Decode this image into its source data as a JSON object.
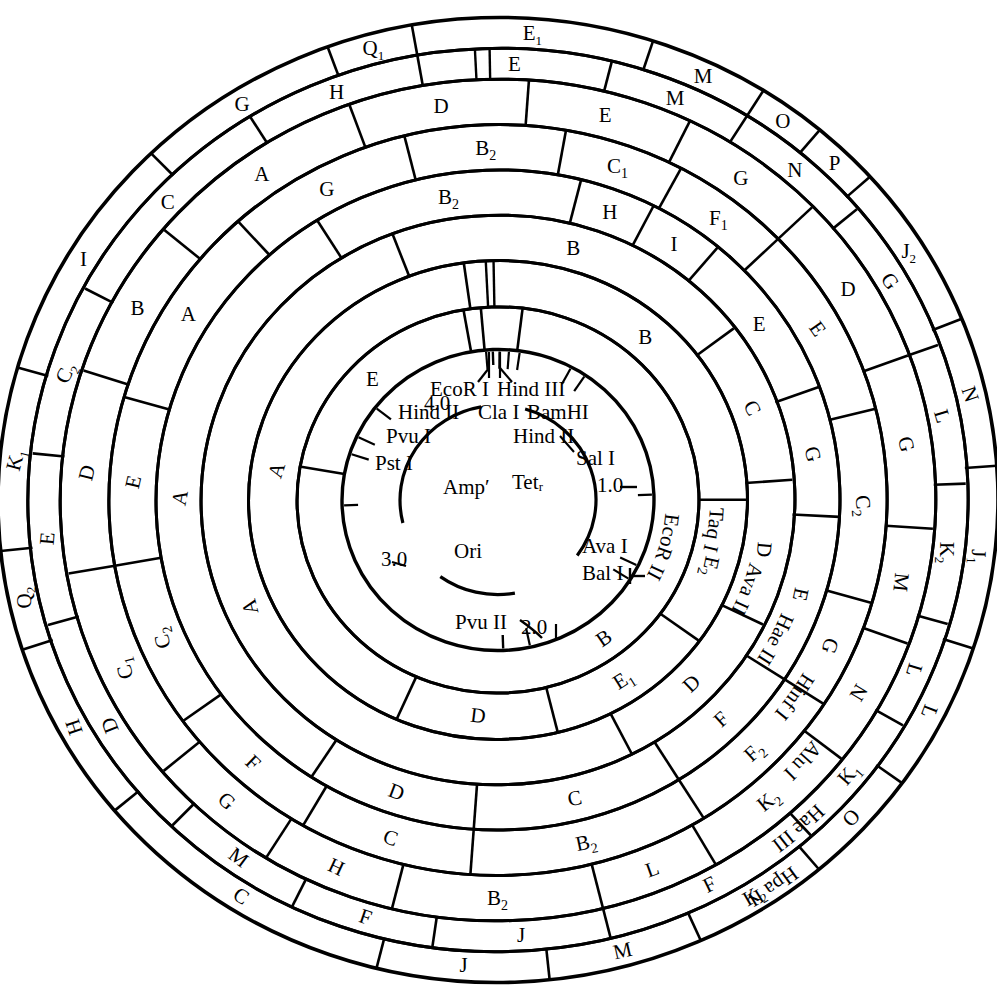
{
  "figure": {
    "type": "circular-restriction-map",
    "plasmid": "pBR322",
    "center": {
      "cx": 498,
      "cy": 500
    },
    "coordinates": [
      "1.0",
      "2.0",
      "3.0",
      "4.0"
    ],
    "genes": [
      "Amp′",
      "Tetᵣ",
      "Ori"
    ],
    "inner_sites": [
      "EcoR I",
      "Hind III",
      "Cla I",
      "BamHI",
      "Hind II",
      "Sal I",
      "Hind II",
      "Pvu I",
      "Pst I",
      "Ava I",
      "Bal I",
      "Pvu II"
    ]
  },
  "rings": [
    {
      "index": 0,
      "enzyme": "EcoR II",
      "enzyme_label_angle": 108,
      "r_inner": 156,
      "r_outer": 200,
      "segments": [
        {
          "label": "B",
          "start": 9,
          "end": 282
        },
        {
          "label": "E",
          "start": 282,
          "end": 352
        },
        {
          "label": "",
          "start": 352,
          "end": 357
        },
        {
          "label": "",
          "start": 357,
          "end": 369
        }
      ]
    },
    {
      "index": 1,
      "enzyme": "Taq I",
      "enzyme_label_angle": 100,
      "r_inner": 200,
      "r_outer": 248,
      "segments": [
        {
          "label": "B",
          "start": 354,
          "end": 92
        },
        {
          "label": "E₂",
          "start": 92,
          "end": 128
        },
        {
          "label": "E₁",
          "start": 128,
          "end": 168
        },
        {
          "label": "D",
          "start": 168,
          "end": 206
        },
        {
          "label": "A",
          "start": 206,
          "end": 354
        }
      ]
    },
    {
      "index": 2,
      "enzyme": "Ava II",
      "enzyme_label_angle": 112,
      "r_inner": 248,
      "r_outer": 295,
      "segments": [
        {
          "label": "B",
          "start": 341,
          "end": 55
        },
        {
          "label": "C",
          "start": 55,
          "end": 88
        },
        {
          "label": "D",
          "start": 88,
          "end": 118
        },
        {
          "label": "D",
          "start": 118,
          "end": 155
        },
        {
          "label": "A",
          "start": 155,
          "end": 341
        }
      ]
    },
    {
      "index": 3,
      "enzyme": "Hae II",
      "enzyme_label_angle": 119,
      "r_inner": 295,
      "r_outer": 342,
      "segments": [
        {
          "label": "B₂",
          "start": 330,
          "end": 16
        },
        {
          "label": "H",
          "start": 16,
          "end": 29
        },
        {
          "label": "I",
          "start": 29,
          "end": 42
        },
        {
          "label": "E",
          "start": 42,
          "end": 72
        },
        {
          "label": "G",
          "start": 72,
          "end": 95
        },
        {
          "label": "E",
          "start": 95,
          "end": 125
        },
        {
          "label": "F",
          "start": 125,
          "end": 150
        },
        {
          "label": "C",
          "start": 150,
          "end": 186
        },
        {
          "label": "D",
          "start": 186,
          "end": 215
        },
        {
          "label": "A",
          "start": 215,
          "end": 330
        }
      ]
    },
    {
      "index": 4,
      "enzyme": "Hinf I",
      "enzyme_label_angle": 126,
      "r_inner": 342,
      "r_outer": 389,
      "segments": [
        {
          "label": "G",
          "start": 320,
          "end": 348
        },
        {
          "label": "B₂",
          "start": 348,
          "end": 12
        },
        {
          "label": "C₁",
          "start": 12,
          "end": 30
        },
        {
          "label": "F₁",
          "start": 30,
          "end": 48
        },
        {
          "label": "E",
          "start": 48,
          "end": 78
        },
        {
          "label": "C₂",
          "start": 78,
          "end": 108
        },
        {
          "label": "G",
          "start": 108,
          "end": 125
        },
        {
          "label": "F₂",
          "start": 125,
          "end": 150
        },
        {
          "label": "B₂",
          "start": 150,
          "end": 186
        },
        {
          "label": "C",
          "start": 186,
          "end": 212
        },
        {
          "label": "F",
          "start": 212,
          "end": 236
        },
        {
          "label": "C₂",
          "start": 236,
          "end": 262
        },
        {
          "label": "E",
          "start": 262,
          "end": 288
        },
        {
          "label": "A",
          "start": 288,
          "end": 320
        }
      ]
    },
    {
      "index": 5,
      "enzyme": "Alu I",
      "enzyme_label_angle": 133,
      "r_inner": 389,
      "r_outer": 436,
      "segments": [
        {
          "label": "A",
          "start": 312,
          "end": 342
        },
        {
          "label": "D",
          "start": 342,
          "end": 6
        },
        {
          "label": "E",
          "start": 6,
          "end": 28
        },
        {
          "label": "G",
          "start": 28,
          "end": 48
        },
        {
          "label": "D",
          "start": 48,
          "end": 72
        },
        {
          "label": "G",
          "start": 72,
          "end": 96
        },
        {
          "label": "M",
          "start": 96,
          "end": 112
        },
        {
          "label": "N",
          "start": 112,
          "end": 130
        },
        {
          "label": "K₂",
          "start": 130,
          "end": 152
        },
        {
          "label": "L",
          "start": 152,
          "end": 168
        },
        {
          "label": "B₂",
          "start": 168,
          "end": 196
        },
        {
          "label": "H",
          "start": 196,
          "end": 214
        },
        {
          "label": "G",
          "start": 214,
          "end": 232
        },
        {
          "label": "C₁",
          "start": 232,
          "end": 262
        },
        {
          "label": "D",
          "start": 262,
          "end": 290
        },
        {
          "label": "B",
          "start": 290,
          "end": 312
        }
      ]
    },
    {
      "index": 6,
      "enzyme": "Hae III",
      "enzyme_label_angle": 140,
      "r_inner": 436,
      "r_outer": 468,
      "segments": [
        {
          "label": "C",
          "start": 300,
          "end": 330
        },
        {
          "label": "H",
          "start": 330,
          "end": 352
        },
        {
          "label": "E",
          "start": 352,
          "end": 16
        },
        {
          "label": "M",
          "start": 16,
          "end": 34
        },
        {
          "label": "N",
          "start": 34,
          "end": 52
        },
        {
          "label": "G",
          "start": 52,
          "end": 72
        },
        {
          "label": "L",
          "start": 72,
          "end": 90
        },
        {
          "label": "K₂",
          "start": 90,
          "end": 108
        },
        {
          "label": "L",
          "start": 108,
          "end": 122
        },
        {
          "label": "K₁",
          "start": 122,
          "end": 140
        },
        {
          "label": "F",
          "start": 140,
          "end": 168
        },
        {
          "label": "J",
          "start": 168,
          "end": 190
        },
        {
          "label": "F",
          "start": 190,
          "end": 208
        },
        {
          "label": "M",
          "start": 208,
          "end": 226
        },
        {
          "label": "D",
          "start": 226,
          "end": 256
        },
        {
          "label": "E",
          "start": 256,
          "end": 278
        },
        {
          "label": "C₂",
          "start": 278,
          "end": 300
        }
      ]
    },
    {
      "index": 7,
      "enzyme": "Hpa II",
      "enzyme_label_angle": 147,
      "r_inner": 468,
      "r_outer": 500,
      "segments": [
        {
          "label": "I",
          "start": 288,
          "end": 318
        },
        {
          "label": "G",
          "start": 318,
          "end": 342
        },
        {
          "label": "Q₁",
          "start": 342,
          "end": 352
        },
        {
          "label": "E₁",
          "start": 352,
          "end": 20
        },
        {
          "label": "M",
          "start": 20,
          "end": 34
        },
        {
          "label": "O",
          "start": 34,
          "end": 42
        },
        {
          "label": "P",
          "start": 42,
          "end": 50
        },
        {
          "label": "J₂",
          "start": 50,
          "end": 70
        },
        {
          "label": "N",
          "start": 70,
          "end": 88
        },
        {
          "label": "J₁",
          "start": 88,
          "end": 110
        },
        {
          "label": "L",
          "start": 110,
          "end": 128
        },
        {
          "label": "O",
          "start": 128,
          "end": 142
        },
        {
          "label": "K₂",
          "start": 142,
          "end": 158
        },
        {
          "label": "M",
          "start": 158,
          "end": 176
        },
        {
          "label": "J",
          "start": 176,
          "end": 196
        },
        {
          "label": "C",
          "start": 196,
          "end": 232
        },
        {
          "label": "H",
          "start": 232,
          "end": 254
        },
        {
          "label": "Q₂",
          "start": 254,
          "end": 266
        },
        {
          "label": "K₁",
          "start": 266,
          "end": 288
        }
      ]
    }
  ],
  "outer_labels_left": [
    "E₂",
    "J",
    "K₂",
    "O",
    "C",
    "H",
    "Q₂",
    "K₁"
  ],
  "page_bg": "#ffffff",
  "ink": "#000000"
}
